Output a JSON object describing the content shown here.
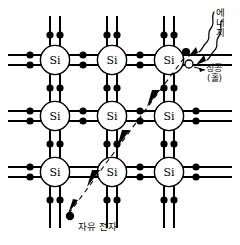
{
  "figure": {
    "subject": "Si",
    "atom_label": "Si",
    "colors": {
      "line": "#000000",
      "electron_fill": "#000000",
      "hole_fill": "#ffffff",
      "background": "#ffffff",
      "text": "#111111"
    }
  },
  "annotations": {
    "energy": {
      "text": "에너지",
      "meaning": "energy",
      "orientation": "vertical"
    },
    "hole": {
      "line1": "정공",
      "line2": "(홀)",
      "meaning": "positive hole"
    },
    "free_electron": {
      "text": "자유 전자",
      "meaning": "free electron"
    }
  },
  "lattice": {
    "atom_label": "Si",
    "rows": 3,
    "cols": 3,
    "atom_radius": 15,
    "centers_x": [
      55,
      112,
      169
    ],
    "centers_y": [
      60,
      116,
      172
    ],
    "bond_offset": 5,
    "electron_radius": 3.6
  },
  "particles": {
    "hole_marker": {
      "cx": 189,
      "cy": 64,
      "r": 3.6,
      "style": "open-circle"
    },
    "excited_electron": {
      "cx": 186,
      "cy": 52,
      "r": 3.6,
      "style": "filled-circle"
    },
    "free_electron": {
      "cx": 70,
      "cy": 216,
      "r": 3.8,
      "style": "filled-circle"
    }
  },
  "trajectory": {
    "description": "dashed path from hole site down-left to free electron",
    "points": [
      [
        186,
        58
      ],
      [
        70,
        214
      ]
    ],
    "arrowheads": [
      [
        155,
        100
      ],
      [
        124,
        139
      ],
      [
        94,
        177
      ]
    ]
  },
  "energy_arrows": {
    "count": 2,
    "description": "two wavy arrows pointing down-left into the lattice"
  }
}
